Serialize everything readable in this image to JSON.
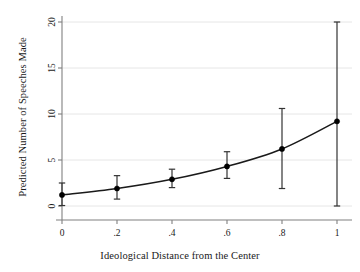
{
  "chart_data": {
    "type": "line",
    "title": "",
    "xlabel": "Ideological Distance from the Center",
    "ylabel": "Predicted Number of Speeches Made",
    "x": [
      0,
      0.2,
      0.4,
      0.6,
      0.8,
      1.0
    ],
    "values": [
      1.2,
      1.9,
      2.9,
      4.3,
      6.2,
      9.2
    ],
    "series": [
      {
        "name": "Predicted Number of Speeches Made",
        "values": [
          1.2,
          1.9,
          2.9,
          4.3,
          6.2,
          9.2
        ],
        "error_low": [
          0.05,
          0.75,
          2.0,
          3.0,
          1.9,
          0.0
        ],
        "error_high": [
          2.5,
          3.3,
          4.0,
          5.9,
          10.6,
          20.0
        ]
      }
    ],
    "xtick_labels": [
      "0",
      ".2",
      ".4",
      ".6",
      ".8",
      "1"
    ],
    "xtick_values": [
      0,
      0.2,
      0.4,
      0.6,
      0.8,
      1
    ],
    "ytick_labels": [
      "0",
      "5",
      "10",
      "15",
      "20"
    ],
    "ytick_values": [
      0,
      5,
      10,
      15,
      20
    ],
    "xlim": [
      0,
      1
    ],
    "ylim": [
      0,
      20
    ],
    "grid": "horizontal",
    "legend": "none",
    "marker": "filled-circle",
    "error_bar_style": "capped-vertical",
    "colors": {
      "line": "#1a1a1a",
      "marker": "#000000",
      "error_bar": "#333333",
      "gridline": "#e6e6e6",
      "axis": "#808080",
      "background": "#ffffff",
      "text": "#1a1a1a"
    }
  },
  "axes": {
    "x_title": "Ideological Distance from the Center",
    "y_title": "Predicted Number of Speeches Made"
  },
  "ticks": {
    "x": [
      {
        "label": "0"
      },
      {
        "label": ".2"
      },
      {
        "label": ".4"
      },
      {
        "label": ".6"
      },
      {
        "label": ".8"
      },
      {
        "label": "1"
      }
    ],
    "y": [
      {
        "label": "0"
      },
      {
        "label": "5"
      },
      {
        "label": "10"
      },
      {
        "label": "15"
      },
      {
        "label": "20"
      }
    ]
  }
}
